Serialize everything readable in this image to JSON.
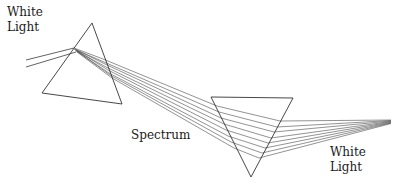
{
  "diagram": {
    "labels": {
      "white_light_in_line1": "White",
      "white_light_in_line2": "Light",
      "spectrum": "Spectrum",
      "white_light_out_line1": "White",
      "white_light_out_line2": "Light"
    },
    "colors": {
      "line": "#3a3a3a",
      "background": "#ffffff"
    },
    "prisms": [
      {
        "name": "dispersing-prism",
        "orientation": "apex-up",
        "points": [
          [
            92,
            23
          ],
          [
            42,
            93
          ],
          [
            122,
            104
          ]
        ]
      },
      {
        "name": "recombining-prism",
        "orientation": "apex-down",
        "points": [
          [
            211,
            97
          ],
          [
            293,
            98
          ],
          [
            251,
            177
          ]
        ]
      }
    ],
    "ray_count": 8
  }
}
